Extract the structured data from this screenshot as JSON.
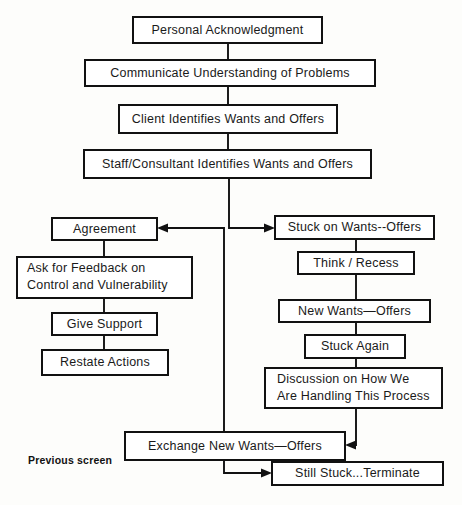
{
  "diagram": {
    "title_caption": "Previous screen",
    "background_color": "#fdfdfb",
    "line_color": "#111111",
    "box_fill": "#ffffff",
    "nodes": {
      "personal_acknowledgment": "Personal Acknowledgment",
      "communicate_understanding": "Communicate Understanding of Problems",
      "client_identifies": "Client Identifies Wants and Offers",
      "staff_identifies": "Staff/Consultant Identifies Wants and Offers",
      "agreement": "Agreement",
      "ask_feedback_line1": "Ask for Feedback on",
      "ask_feedback_line2": "Control and Vulnerability",
      "give_support": "Give Support",
      "restate_actions": "Restate Actions",
      "stuck_on_wants": "Stuck on Wants--Offers",
      "think_recess": "Think / Recess",
      "new_wants_offers": "New Wants—Offers",
      "stuck_again": "Stuck Again",
      "discussion_line1": "Discussion on How We",
      "discussion_line2": "Are Handling This Process",
      "exchange_new_wants": "Exchange New Wants—Offers",
      "still_stuck_terminate": "Still Stuck...Terminate"
    }
  }
}
